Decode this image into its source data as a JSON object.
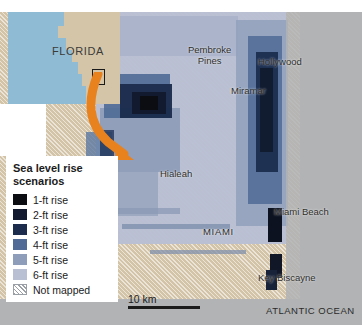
{
  "figure": {
    "kind": "thematic-map"
  },
  "inset": {
    "label": "FLORIDA",
    "locator_box": "study-area-locator",
    "water_color": "#8fbcd4",
    "land_color": "#d4c5a9"
  },
  "arrow": {
    "color": "#e8821e",
    "meaning": "inset-to-detail-pointer"
  },
  "legend": {
    "title": "Sea level rise scenarios",
    "items": [
      {
        "label": "1-ft rise",
        "color": "#0b0d12"
      },
      {
        "label": "2-ft rise",
        "color": "#111a2e"
      },
      {
        "label": "3-ft rise",
        "color": "#1b2c4d"
      },
      {
        "label": "4-ft rise",
        "color": "#4f6b96"
      },
      {
        "label": "5-ft rise",
        "color": "#8e9db9"
      },
      {
        "label": "6-ft rise",
        "color": "#b9c0d4"
      }
    ],
    "not_mapped": {
      "label": "Not mapped",
      "pattern": "diagonal-hatch"
    }
  },
  "scale": {
    "label": "10 km"
  },
  "places": [
    {
      "name": "Pembroke Pines",
      "x": 193,
      "y": 48,
      "style": "two"
    },
    {
      "name": "Hollywood",
      "x": 258,
      "y": 56,
      "style": "one"
    },
    {
      "name": "Miramar",
      "x": 231,
      "y": 83,
      "style": "one"
    },
    {
      "name": "Hialeah",
      "x": 162,
      "y": 167,
      "style": "one"
    },
    {
      "name": "MIAMI",
      "x": 205,
      "y": 226,
      "style": "caps"
    },
    {
      "name": "Miami Beach",
      "x": 275,
      "y": 206,
      "style": "one"
    },
    {
      "name": "Key Biscayne",
      "x": 262,
      "y": 273,
      "style": "one"
    }
  ],
  "ocean": {
    "label": "ATLANTIC OCEAN",
    "color": "#b1b3b5"
  }
}
